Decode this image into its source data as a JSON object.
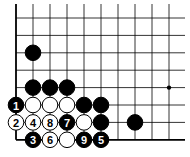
{
  "diagram": {
    "type": "go-board-fragment",
    "grid": {
      "cols": 10,
      "rows": 8,
      "origin_x": 16,
      "origin_y": 18,
      "spacing_x": 17,
      "spacing_y": 17.4,
      "edges": [
        "left",
        "bottom"
      ]
    },
    "star_points": [
      {
        "col": 9,
        "row": 4
      }
    ],
    "stones": [
      {
        "col": 1,
        "row": 2,
        "color": "black",
        "label": ""
      },
      {
        "col": 1,
        "row": 4,
        "color": "black",
        "label": ""
      },
      {
        "col": 2,
        "row": 4,
        "color": "black",
        "label": ""
      },
      {
        "col": 3,
        "row": 4,
        "color": "black",
        "label": ""
      },
      {
        "col": 0,
        "row": 5,
        "color": "black",
        "label": "1"
      },
      {
        "col": 1,
        "row": 5,
        "color": "white",
        "label": ""
      },
      {
        "col": 2,
        "row": 5,
        "color": "white",
        "label": ""
      },
      {
        "col": 3,
        "row": 5,
        "color": "white",
        "label": ""
      },
      {
        "col": 4,
        "row": 5,
        "color": "black",
        "label": ""
      },
      {
        "col": 5,
        "row": 5,
        "color": "black",
        "label": ""
      },
      {
        "col": 0,
        "row": 6,
        "color": "white",
        "label": "2"
      },
      {
        "col": 1,
        "row": 6,
        "color": "white",
        "label": "4"
      },
      {
        "col": 2,
        "row": 6,
        "color": "white",
        "label": "8"
      },
      {
        "col": 3,
        "row": 6,
        "color": "black",
        "label": "7"
      },
      {
        "col": 4,
        "row": 6,
        "color": "white",
        "label": ""
      },
      {
        "col": 5,
        "row": 6,
        "color": "black",
        "label": ""
      },
      {
        "col": 7,
        "row": 6,
        "color": "black",
        "label": ""
      },
      {
        "col": 1,
        "row": 7,
        "color": "black",
        "label": "3"
      },
      {
        "col": 2,
        "row": 7,
        "color": "white",
        "label": "6"
      },
      {
        "col": 3,
        "row": 7,
        "color": "white",
        "label": ""
      },
      {
        "col": 4,
        "row": 7,
        "color": "black",
        "label": "9"
      },
      {
        "col": 5,
        "row": 7,
        "color": "black",
        "label": "5"
      }
    ]
  }
}
